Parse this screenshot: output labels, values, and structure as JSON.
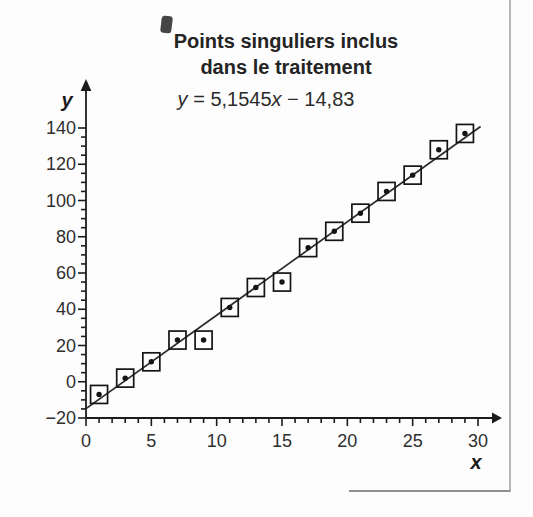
{
  "chart": {
    "title_line1": "Points singuliers inclus",
    "title_line2": "dans le traitement",
    "equation": {
      "var_y": "y",
      "mid": " = 5,1545",
      "var_x": "x",
      "tail": " − 14,83"
    }
  },
  "chart_data": {
    "type": "scatter",
    "title": "Points singuliers inclus dans le traitement",
    "equation_text": "y = 5,1545x − 14,83",
    "fit": {
      "slope": 5.1545,
      "intercept": -14.83
    },
    "xlabel": "x",
    "ylabel": "y",
    "x": [
      1,
      3,
      5,
      7,
      9,
      11,
      13,
      15,
      17,
      19,
      21,
      23,
      25,
      27,
      29
    ],
    "y": [
      -7,
      2,
      11,
      23,
      23,
      41,
      52,
      55,
      74,
      83,
      93,
      105,
      114,
      128,
      137
    ],
    "xlim": [
      0,
      30
    ],
    "ylim": [
      -20,
      140
    ],
    "x_major_step": 5,
    "x_minor_step": 1,
    "y_major_step": 20,
    "y_minor_step": 5,
    "x_tick_values": [
      0,
      5,
      10,
      15,
      20,
      25,
      30
    ],
    "x_tick_labels": [
      "0",
      "5",
      "10",
      "15",
      "20",
      "25",
      "30"
    ],
    "y_tick_values": [
      -20,
      0,
      20,
      40,
      60,
      80,
      100,
      120,
      140
    ],
    "y_tick_labels": [
      "−20",
      "0",
      "20",
      "40",
      "60",
      "80",
      "100",
      "120",
      "140"
    ],
    "marker": "dot-in-square",
    "grid": false,
    "legend": null,
    "colors": {
      "axis": "#1c1c1c",
      "marker": "#141414",
      "fit_line": "#2a2a2a",
      "tick_label": "#2f2f2f"
    }
  }
}
